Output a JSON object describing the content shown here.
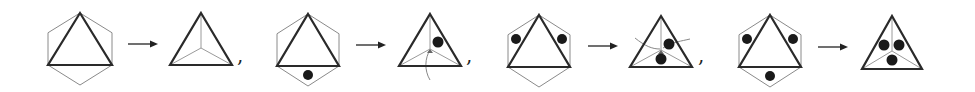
{
  "diagram": {
    "colors": {
      "triangle": "#2a2a2a",
      "hexagon": "#8a8a8a",
      "dot": "#1a1a1a",
      "spoke": "#9a9a9a"
    },
    "separator": ",",
    "steps": [
      {
        "before": {
          "cx": 80,
          "apex_y": 13,
          "base_y": 65,
          "half_w": 32,
          "hex_bottom_y": 85,
          "dots": []
        },
        "after": {
          "cx": 201,
          "apex_y": 13,
          "base_y": 65,
          "half_w": 31,
          "center_y": 48,
          "dots": [],
          "curves": []
        },
        "arrow": {
          "x1": 128,
          "x2": 158,
          "y": 44
        },
        "comma": {
          "x": 237,
          "y": 62
        }
      },
      {
        "before": {
          "cx": 308,
          "apex_y": 14,
          "base_y": 66,
          "half_w": 31,
          "hex_bottom_y": 86,
          "dots": [
            [
              308,
              75
            ]
          ]
        },
        "after": {
          "cx": 430,
          "apex_y": 14,
          "base_y": 66,
          "half_w": 31,
          "center_y": 49,
          "dots": [
            [
              438,
              42
            ]
          ],
          "curves": [
            "M430,80 C424,70 425,58 430,50"
          ]
        },
        "arrow": {
          "x1": 356,
          "x2": 386,
          "y": 45
        },
        "comma": {
          "x": 466,
          "y": 62
        }
      },
      {
        "before": {
          "cx": 539,
          "apex_y": 15,
          "base_y": 67,
          "half_w": 31,
          "hex_bottom_y": 87,
          "dots": [
            [
              516,
              39
            ],
            [
              562,
              39
            ]
          ]
        },
        "after": {
          "cx": 661,
          "apex_y": 16,
          "base_y": 67,
          "half_w": 31,
          "center_y": 50,
          "dots": [
            [
              669,
              44
            ],
            [
              661,
              59
            ]
          ],
          "curves": [
            "M635,38 C645,46 652,49 660,49",
            "M690,39 C682,41 672,42 663,48"
          ]
        },
        "arrow": {
          "x1": 588,
          "x2": 618,
          "y": 46
        },
        "comma": {
          "x": 698,
          "y": 62
        }
      },
      {
        "before": {
          "cx": 770,
          "apex_y": 15,
          "base_y": 67,
          "half_w": 31,
          "hex_bottom_y": 87,
          "dots": [
            [
              747,
              39
            ],
            [
              793,
              39
            ],
            [
              770,
              76
            ]
          ]
        },
        "after": {
          "cx": 892,
          "apex_y": 16,
          "base_y": 69,
          "half_w": 30,
          "center_y": 51,
          "dots": [
            [
              884,
              45
            ],
            [
              899,
              45
            ],
            [
              892,
              60
            ]
          ],
          "curves": []
        },
        "arrow": {
          "x1": 818,
          "x2": 848,
          "y": 47
        },
        "comma": null
      }
    ]
  }
}
